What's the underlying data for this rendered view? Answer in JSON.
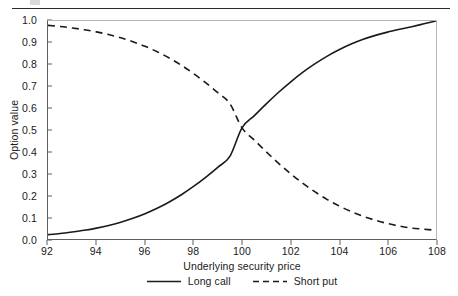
{
  "page": {
    "divider_present": true
  },
  "chart_data": {
    "type": "line",
    "title": "",
    "xlabel": "Underlying security price",
    "ylabel": "Option value",
    "xlim": [
      92,
      108
    ],
    "ylim": [
      0.0,
      1.0
    ],
    "grid": false,
    "legend_position": "bottom-center",
    "xticks": [
      92,
      94,
      96,
      98,
      100,
      102,
      104,
      106,
      108
    ],
    "xticklabels": [
      "92",
      "94",
      "96",
      "98",
      "100",
      "102",
      "104",
      "106",
      "108"
    ],
    "yticks": [
      0.0,
      0.1,
      0.2,
      0.3,
      0.4,
      0.5,
      0.6,
      0.7,
      0.8,
      0.9,
      1.0
    ],
    "yticklabels": [
      "0.0",
      "0.1",
      "0.2",
      "0.3",
      "0.4",
      "0.5",
      "0.6",
      "0.7",
      "0.8",
      "0.9",
      "1.0"
    ],
    "x": [
      92,
      92.5,
      93,
      93.5,
      94,
      94.5,
      95,
      95.5,
      96,
      96.5,
      97,
      97.5,
      98,
      98.5,
      99,
      99.5,
      100,
      100.5,
      101,
      101.5,
      102,
      102.5,
      103,
      103.5,
      104,
      104.5,
      105,
      105.5,
      106,
      106.5,
      107,
      107.5,
      108
    ],
    "series": [
      {
        "name": "Long call",
        "style": "solid",
        "color": "#1a1a1a",
        "values": [
          0.02,
          0.025,
          0.032,
          0.04,
          0.05,
          0.062,
          0.077,
          0.095,
          0.116,
          0.141,
          0.17,
          0.203,
          0.241,
          0.283,
          0.329,
          0.379,
          0.51,
          0.565,
          0.62,
          0.672,
          0.72,
          0.764,
          0.803,
          0.838,
          0.868,
          0.894,
          0.916,
          0.934,
          0.949,
          0.962,
          0.974,
          0.987,
          1.0
        ]
      },
      {
        "name": "Short put",
        "style": "dashed",
        "color": "#1a1a1a",
        "values": [
          0.98,
          0.975,
          0.968,
          0.96,
          0.95,
          0.938,
          0.923,
          0.905,
          0.884,
          0.859,
          0.83,
          0.797,
          0.759,
          0.717,
          0.671,
          0.621,
          0.51,
          0.455,
          0.4,
          0.348,
          0.3,
          0.256,
          0.217,
          0.182,
          0.152,
          0.126,
          0.104,
          0.086,
          0.071,
          0.059,
          0.05,
          0.045,
          0.04
        ]
      }
    ],
    "annotations": [
      {
        "name": "crossover",
        "x": 100,
        "y": 0.51
      }
    ]
  },
  "legend": {
    "entries": [
      {
        "label": "Long call",
        "style": "solid"
      },
      {
        "label": "Short put",
        "style": "dashed"
      }
    ]
  }
}
